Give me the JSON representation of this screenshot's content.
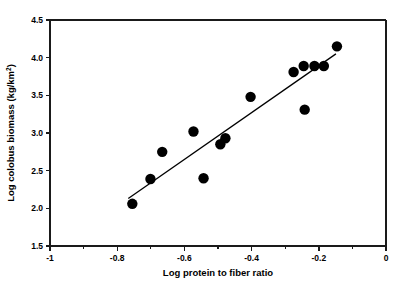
{
  "chart_data": {
    "type": "scatter",
    "title": "",
    "xlabel": "Log protein to fiber ratio",
    "ylabel": "Log colobus biomass (kg/km2)",
    "ylabel_main": "Log colobus biomass (kg/km",
    "ylabel_sup": "2",
    "ylabel_tail": ")",
    "xlim": [
      -1,
      0
    ],
    "ylim": [
      1.5,
      4.5
    ],
    "grid": false,
    "legend": "none",
    "x_ticks": [
      -1,
      -0.8,
      -0.6,
      -0.4,
      -0.2,
      0
    ],
    "x_tick_labels": [
      "-1",
      "-0.8",
      "-0.6",
      "-0.4",
      "-0.2",
      "0"
    ],
    "x_minor_ticks": [
      -0.9,
      -0.7,
      -0.5,
      -0.3,
      -0.1
    ],
    "y_ticks": [
      1.5,
      2.0,
      2.5,
      3.0,
      3.5,
      4.0,
      4.5
    ],
    "y_tick_labels": [
      "1.5",
      "2.0",
      "2.5",
      "3.0",
      "3.5",
      "4.0",
      "4.5"
    ],
    "marker": "filled-circle",
    "marker_color": "#000000",
    "marker_size": 5.2,
    "points": [
      {
        "x": -0.755,
        "y": 2.06
      },
      {
        "x": -0.701,
        "y": 2.39
      },
      {
        "x": -0.666,
        "y": 2.75
      },
      {
        "x": -0.573,
        "y": 3.02
      },
      {
        "x": -0.543,
        "y": 2.4
      },
      {
        "x": -0.493,
        "y": 2.85
      },
      {
        "x": -0.478,
        "y": 2.93
      },
      {
        "x": -0.403,
        "y": 3.48
      },
      {
        "x": -0.275,
        "y": 3.81
      },
      {
        "x": -0.245,
        "y": 3.89
      },
      {
        "x": -0.242,
        "y": 3.31
      },
      {
        "x": -0.213,
        "y": 3.89
      },
      {
        "x": -0.185,
        "y": 3.89
      },
      {
        "x": -0.146,
        "y": 4.15
      }
    ],
    "trend_line": {
      "x_start": -0.767,
      "y_start": 2.13,
      "x_end": -0.149,
      "y_end": 4.05,
      "color": "#000000"
    }
  },
  "caption": {
    "text": "partial text of figure caption visible at bottom edge"
  }
}
